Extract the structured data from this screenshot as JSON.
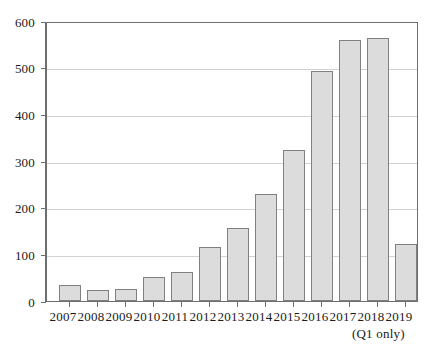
{
  "chart_data": {
    "type": "bar",
    "title": "",
    "subtitle": "",
    "xlabel": "",
    "ylabel": "",
    "categories": [
      "2007",
      "2008",
      "2009",
      "2010",
      "2011",
      "2012",
      "2013",
      "2014",
      "2015",
      "2016",
      "2017",
      "2018",
      "2019"
    ],
    "values": [
      35,
      23,
      25,
      52,
      63,
      117,
      157,
      232,
      325,
      497,
      563,
      567,
      123
    ],
    "ylim": [
      0,
      600
    ],
    "ytick_labels": [
      "0",
      "100",
      "200",
      "300",
      "400",
      "500",
      "600"
    ],
    "ytick_values": [
      0,
      100,
      200,
      300,
      400,
      500,
      600
    ],
    "grid": true,
    "grid_axis": "y",
    "legend": null,
    "annotations": [
      {
        "text": "(Q1 only)",
        "attached_to": "2019",
        "position": "below-x-axis"
      }
    ],
    "colors": {
      "bar_fill": "#dcdcdc",
      "bar_border": "#808080",
      "gridline": "#d2d2d2",
      "axis": "#6e6e6e",
      "text": "#1a1a1a",
      "background": "#ffffff"
    }
  }
}
